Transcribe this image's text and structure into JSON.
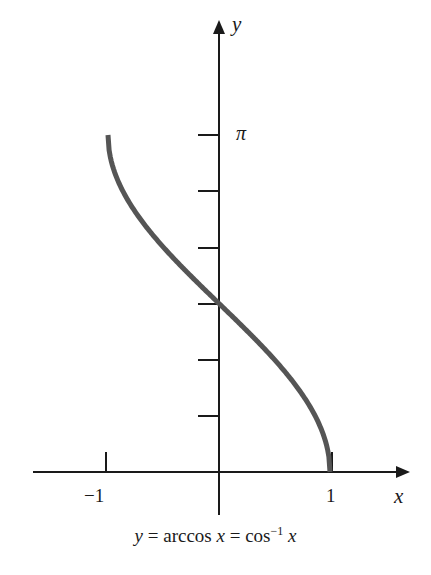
{
  "chart_data": {
    "type": "line",
    "caption": {
      "lhs": "y",
      "eq1": " = arccos ",
      "x1": "x",
      "eq2": " = cos",
      "sup": "−1",
      "x2": " x"
    },
    "xlabel": "x",
    "ylabel": "y",
    "x_ticks": [
      -1,
      1
    ],
    "x_tick_labels": [
      "−1",
      "1"
    ],
    "y_ticks_count": 6,
    "y_tick_step": "π/6",
    "y_tick_labels": {
      "top": "π"
    },
    "xlim": [
      -1.0,
      1.5
    ],
    "ylim": [
      0,
      3.3
    ],
    "grid": false,
    "series": [
      {
        "name": "arccos x",
        "x": [
          -1,
          -0.9,
          -0.75,
          -0.5,
          -0.25,
          0,
          0.25,
          0.5,
          0.75,
          0.9,
          1
        ],
        "values": [
          3.1416,
          2.6906,
          2.4189,
          2.0944,
          1.8235,
          1.5708,
          1.3181,
          1.0472,
          0.7227,
          0.451,
          0
        ],
        "color": "#555555"
      }
    ]
  },
  "colors": {
    "axis": "#1a1a1a",
    "curve": "#555555",
    "background": "#ffffff"
  }
}
